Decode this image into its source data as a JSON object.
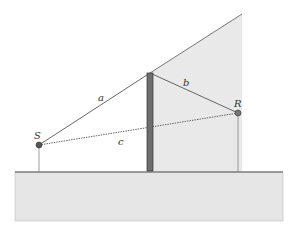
{
  "diagram": {
    "labels": {
      "source": "S",
      "receiver": "R",
      "path_a": "a",
      "path_b": "b",
      "path_c": "c"
    },
    "elements": {
      "ground": "ground",
      "barrier": "barrier",
      "shadow_zone": "shadow zone"
    },
    "colors": {
      "ground_fill": "#e6e6e6",
      "shadow_fill": "#e9e9e9",
      "barrier_fill": "#6e6e6e",
      "line": "#555555",
      "point": "#555555"
    }
  }
}
